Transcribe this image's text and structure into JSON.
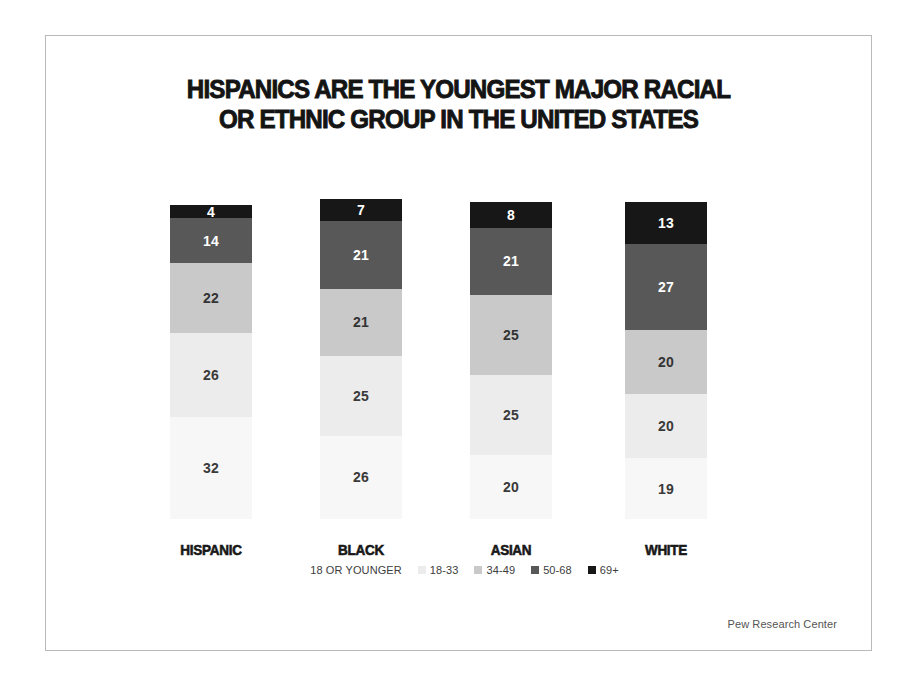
{
  "poster": {
    "title_line_1": "HISPANICS ARE THE YOUNGEST MAJOR RACIAL",
    "title_line_2": "OR ETHNIC GROUP IN THE UNITED STATES",
    "source": "Pew Research Center"
  },
  "chart_data": {
    "type": "bar",
    "subtype": "stacked-bar-100",
    "title": "HISPANICS ARE THE YOUNGEST MAJOR RACIAL OR ETHNIC GROUP IN THE UNITED STATES",
    "xlabel": "",
    "ylabel": "",
    "ylim": [
      0,
      100
    ],
    "grid": false,
    "legend_position": "bottom",
    "orientation": "vertical",
    "stack_order_bottom_to_top": [
      "18 OR YOUNGER",
      "18-33",
      "34-49",
      "50-68",
      "69+"
    ],
    "categories": [
      "HISPANIC",
      "BLACK",
      "ASIAN",
      "WHITE"
    ],
    "series": [
      {
        "name": "18 OR YOUNGER",
        "color": "#f7f7f7",
        "label_color": "#3a3a3a",
        "values": [
          32,
          26,
          20,
          19
        ]
      },
      {
        "name": "18-33",
        "color": "#ececec",
        "label_color": "#3a3a3a",
        "values": [
          26,
          25,
          25,
          20
        ]
      },
      {
        "name": "34-49",
        "color": "#c9c9c9",
        "label_color": "#333333",
        "values": [
          22,
          21,
          25,
          20
        ]
      },
      {
        "name": "50-68",
        "color": "#585858",
        "label_color": "#ffffff",
        "values": [
          14,
          21,
          21,
          27
        ]
      },
      {
        "name": "69+",
        "color": "#171717",
        "label_color": "#ffffff",
        "values": [
          4,
          7,
          8,
          13
        ]
      }
    ],
    "legend": [
      {
        "label": "18 OR YOUNGER",
        "color": "#f7f7f7"
      },
      {
        "label": "18-33",
        "color": "#ececec"
      },
      {
        "label": "34-49",
        "color": "#c9c9c9"
      },
      {
        "label": "50-68",
        "color": "#585858"
      },
      {
        "label": "69+",
        "color": "#171717"
      }
    ]
  }
}
